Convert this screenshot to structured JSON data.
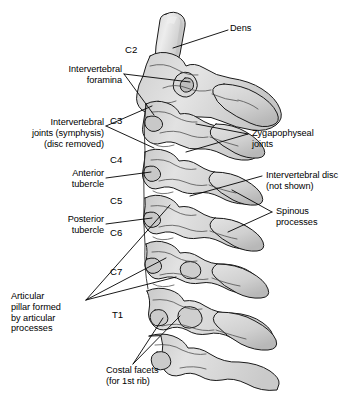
{
  "figure": {
    "background_color": "#ffffff",
    "bone_fill_light": "#e6e6e6",
    "bone_fill_mid": "#d2d2d2",
    "bone_fill_dark": "#b9b9b9",
    "outline_color": "#1a1a1a",
    "leader_color": "#000000"
  },
  "labels": {
    "dens": "Dens",
    "intervertebral_foramina": "Intervertebral\nforamina",
    "intervertebral_joints": "Intervertebral\njoints (symphysis)\n(disc removed)",
    "anterior_tubercle": "Anterior\ntubercle",
    "posterior_tubercle": "Posterior\ntubercle",
    "articular_pillar": "Articular\npillar formed\nby articular\nprocesses",
    "costal_facets": "Costal facets\n(for 1st rib)",
    "zygapophyseal_joints": "Zygapophyseal\njoints",
    "intervertebral_disc": "Intervertebral disc\n(not shown)",
    "spinous_processes": "Spinous\nprocesses"
  },
  "vertebra_levels": [
    {
      "id": "c2",
      "label": "C2"
    },
    {
      "id": "c3",
      "label": "C3"
    },
    {
      "id": "c4",
      "label": "C4"
    },
    {
      "id": "c5",
      "label": "C5"
    },
    {
      "id": "c6",
      "label": "C6"
    },
    {
      "id": "c7",
      "label": "C7"
    },
    {
      "id": "t1",
      "label": "T1"
    }
  ]
}
